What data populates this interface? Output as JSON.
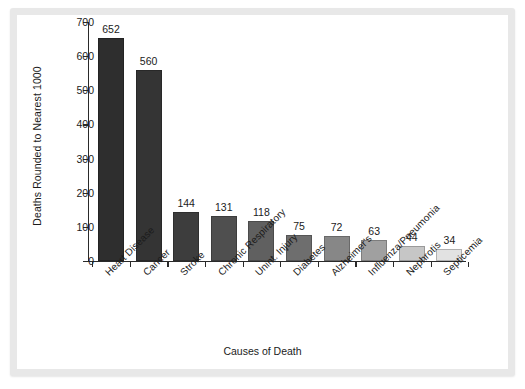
{
  "chart_data": {
    "type": "bar",
    "title": "",
    "xlabel": "Causes of Death",
    "ylabel": "Deaths Rounded to Nearest 1000",
    "ylim": [
      0,
      700
    ],
    "yticks": [
      0,
      100,
      200,
      300,
      400,
      500,
      600,
      700
    ],
    "grid": false,
    "legend": null,
    "categories": [
      "Heart Disease",
      "Cancer",
      "Stroke",
      "Chronic Respiratory",
      "Unint. Injury",
      "Diabetes",
      "Alzheimer's",
      "Influenza/Pneumonia",
      "Nephrotis",
      "Septicemia"
    ],
    "values": [
      652,
      560,
      144,
      131,
      118,
      75,
      72,
      63,
      44,
      34
    ],
    "bar_colors": [
      "#2e2e2e",
      "#343434",
      "#3d3d3d",
      "#4f4f4f",
      "#606060",
      "#6e6e6e",
      "#878787",
      "#a0a0a0",
      "#c6c6c6",
      "#e2e2e2"
    ]
  },
  "frame": {
    "border_color": "#e8e8e8",
    "background": "#ffffff"
  },
  "axis": {
    "line_color": "#2a2a2a"
  }
}
